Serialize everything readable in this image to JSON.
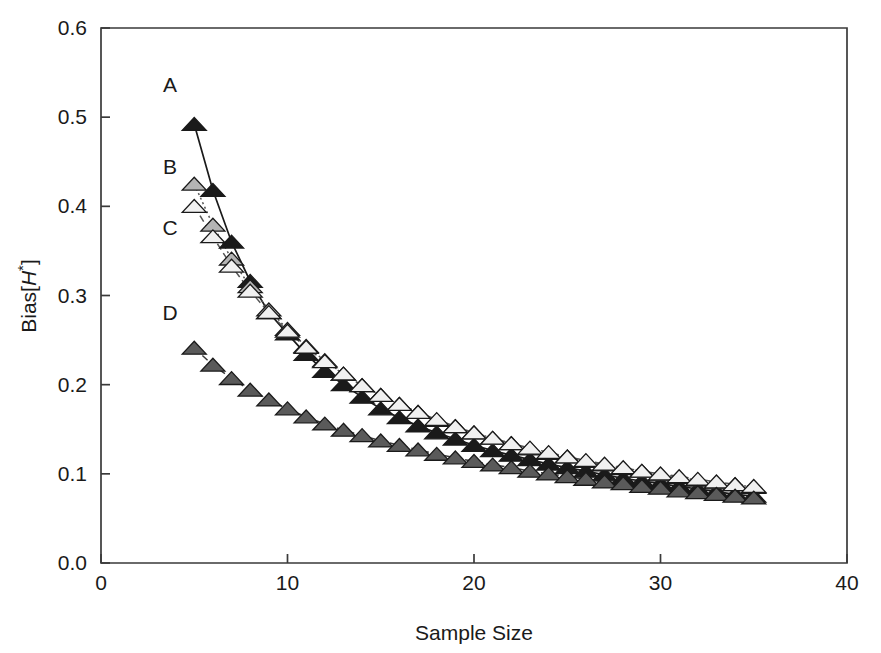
{
  "chart_data": {
    "type": "line",
    "title": "",
    "xlabel": "Sample Size",
    "ylabel": "Bias[H*]",
    "ylabel_parts": {
      "prefix": "Bias[",
      "italic": "H",
      "sup": "*",
      "suffix": "]"
    },
    "xlim": [
      0,
      40
    ],
    "ylim": [
      0.0,
      0.6
    ],
    "xticks": [
      0,
      10,
      20,
      30,
      40
    ],
    "xtick_labels": [
      "0",
      "10",
      "20",
      "30",
      "40"
    ],
    "yticks": [
      0.0,
      0.1,
      0.2,
      0.3,
      0.4,
      0.5,
      0.6
    ],
    "ytick_labels": [
      "0.0",
      "0.1",
      "0.2",
      "0.3",
      "0.4",
      "0.5",
      "0.6"
    ],
    "grid": false,
    "legend_position": "inline-labels-left",
    "annotations": [
      {
        "text": "A",
        "x": 3.7,
        "y": 0.528
      },
      {
        "text": "B",
        "x": 3.7,
        "y": 0.436
      },
      {
        "text": "C",
        "x": 3.7,
        "y": 0.368
      },
      {
        "text": "D",
        "x": 3.7,
        "y": 0.272
      }
    ],
    "x": [
      5,
      6,
      7,
      8,
      9,
      10,
      11,
      12,
      13,
      14,
      15,
      16,
      17,
      18,
      19,
      20,
      21,
      22,
      23,
      24,
      25,
      26,
      27,
      28,
      29,
      30,
      31,
      32,
      33,
      34,
      35
    ],
    "series": [
      {
        "name": "A",
        "marker": "triangle-filled",
        "marker_color": "#1a1a1a",
        "line_style": "solid",
        "line_color": "#1a1a1a",
        "values": [
          0.492,
          0.418,
          0.36,
          0.316,
          0.281,
          0.257,
          0.234,
          0.215,
          0.2,
          0.186,
          0.173,
          0.163,
          0.154,
          0.146,
          0.139,
          0.132,
          0.126,
          0.121,
          0.116,
          0.111,
          0.107,
          0.103,
          0.099,
          0.095,
          0.092,
          0.089,
          0.086,
          0.083,
          0.08,
          0.077,
          0.075
        ]
      },
      {
        "name": "B",
        "marker": "triangle-light-gray",
        "marker_color": "#b4b4b4",
        "line_style": "dotted",
        "line_color": "#555555",
        "values": [
          0.425,
          0.379,
          0.341,
          0.31,
          0.284,
          0.262,
          0.243,
          0.227,
          0.212,
          0.199,
          0.188,
          0.178,
          0.169,
          0.16,
          0.153,
          0.146,
          0.14,
          0.134,
          0.128,
          0.123,
          0.119,
          0.114,
          0.11,
          0.106,
          0.103,
          0.099,
          0.096,
          0.093,
          0.09,
          0.088,
          0.085
        ]
      },
      {
        "name": "C",
        "marker": "triangle-open",
        "marker_color": "#f0f0f0",
        "line_style": "dashed",
        "line_color": "#555555",
        "values": [
          0.4,
          0.366,
          0.333,
          0.305,
          0.281,
          0.26,
          0.242,
          0.226,
          0.212,
          0.199,
          0.188,
          0.178,
          0.169,
          0.161,
          0.153,
          0.146,
          0.14,
          0.134,
          0.129,
          0.124,
          0.119,
          0.115,
          0.111,
          0.107,
          0.103,
          0.1,
          0.097,
          0.094,
          0.091,
          0.088,
          0.086
        ]
      },
      {
        "name": "D",
        "marker": "triangle-dark-gray",
        "marker_color": "#5a5a5a",
        "line_style": "dashed",
        "line_color": "#3a3a3a",
        "values": [
          0.241,
          0.222,
          0.207,
          0.194,
          0.183,
          0.173,
          0.164,
          0.156,
          0.149,
          0.143,
          0.137,
          0.132,
          0.127,
          0.122,
          0.118,
          0.114,
          0.11,
          0.107,
          0.103,
          0.1,
          0.097,
          0.094,
          0.091,
          0.089,
          0.086,
          0.084,
          0.081,
          0.079,
          0.077,
          0.075,
          0.073
        ]
      }
    ]
  }
}
